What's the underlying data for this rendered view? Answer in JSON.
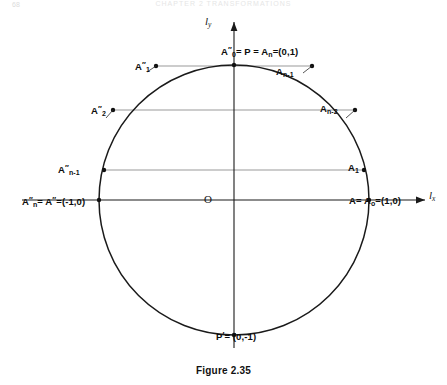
{
  "page": {
    "page_number": "68",
    "running_head": "CHAPTER 2  TRANSFORMATIONS"
  },
  "caption": "Figure 2.35",
  "axes": {
    "y_axis_label_main": "l",
    "y_axis_label_sub": "y",
    "x_axis_label_main": "l",
    "x_axis_label_sub": "x",
    "origin_label": "O"
  },
  "labels": {
    "top_point": {
      "text": "A″₀ = P = Aₙ = (0,1)",
      "parts": {
        "a": "A",
        "a_sup": "″",
        "a_sub": "0",
        "mid": "= P = A",
        "mid_sub": "n",
        "coords": "=(0,1)"
      }
    },
    "left_x_point": {
      "text": "A″ₙ = A″ = (−1,0)",
      "parts": {
        "a": "A",
        "a_sup": "″",
        "a_sub": "n",
        "mid": "= A",
        "mid_sup": "″",
        "coords": "=(-1,0)"
      }
    },
    "right_x_point": {
      "text": "A = A₀ = (1,0)",
      "parts": {
        "a": "A",
        "mid": "= A",
        "mid_sub": "o",
        "coords": "=(1,0)"
      }
    },
    "bottom_point": {
      "text": "P′ = (0,−1)",
      "parts": {
        "p": "P",
        "p_sup": "′",
        "coords": "= (0,-1)"
      }
    },
    "a2_dprime": {
      "base": "A",
      "sup": "″",
      "sub": "2"
    },
    "a1_dprime": {
      "base": "A",
      "sup": "″",
      "sub": "1"
    },
    "an1_dprime": {
      "base": "A",
      "sup": "″",
      "sub": "n-1"
    },
    "a1_right": {
      "base": "A",
      "sub": "1"
    },
    "an2_right": {
      "base": "A",
      "sub": "n-2"
    },
    "an1_right": {
      "base": "A",
      "sub": "n-1"
    }
  },
  "colors": {
    "stroke": "#1a1a1a",
    "chord": "#6e6e6e",
    "background": "#ffffff"
  },
  "geometry": {
    "center_x": 234,
    "center_y": 200,
    "radius": 135,
    "chord_y_values": [
      66,
      110,
      170
    ],
    "point_marker_radius": 2.1
  }
}
